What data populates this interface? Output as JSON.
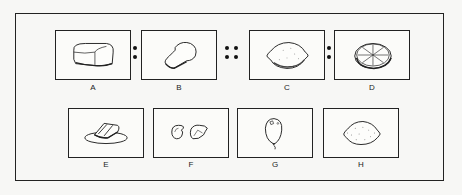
{
  "puzzle": {
    "type": "analogy",
    "relation_operators": [
      ":",
      "::",
      ":"
    ],
    "top_row": [
      {
        "label": "A",
        "icon": "bread-loaf-icon"
      },
      {
        "label": "B",
        "icon": "bread-slice-icon"
      },
      {
        "label": "C",
        "icon": "lemon-icon"
      },
      {
        "label": "D",
        "icon": "lemon-slice-icon"
      }
    ],
    "bottom_row": [
      {
        "label": "E",
        "icon": "cake-slice-on-plate-icon"
      },
      {
        "label": "F",
        "icon": "lemon-peel-pieces-icon"
      },
      {
        "label": "G",
        "icon": "balloon-icon"
      },
      {
        "label": "H",
        "icon": "lemon-icon"
      }
    ]
  }
}
